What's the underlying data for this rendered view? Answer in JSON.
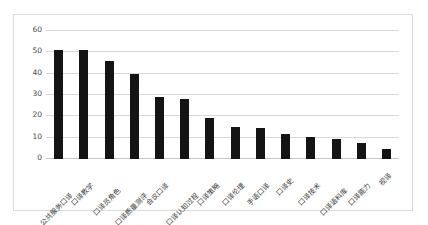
{
  "page": {
    "top_strip_ghost_1": "",
    "top_strip_ghost_2": "",
    "top_strip_ghost_3": ""
  },
  "chart_data": {
    "type": "bar",
    "title": "",
    "subtitle": "",
    "xlabel": "",
    "ylabel": "",
    "ylim": [
      0,
      60
    ],
    "yticks": [
      0,
      10,
      20,
      30,
      40,
      50,
      60
    ],
    "ytick_labels": [
      "0",
      "10",
      "20",
      "30",
      "40",
      "50",
      "60"
    ],
    "grid": true,
    "legend": false,
    "legend_position": "none",
    "bar_color": "#141414",
    "gridline_color": "#d9d9d9",
    "axis_text_color": "#3c3c3c",
    "categories": [
      "公共服务口译",
      "口译教学",
      "口译员角色",
      "口译质量测评",
      "会议口译",
      "口译认知过程",
      "口译策略",
      "口译伦理",
      "手语口译",
      "口译史",
      "口译技术",
      "口译语料库",
      "口译能力",
      "视译"
    ],
    "values": [
      51,
      51,
      46,
      40,
      29,
      28,
      19,
      15,
      14.5,
      11.5,
      10.5,
      9.5,
      7.5,
      4.5
    ]
  }
}
